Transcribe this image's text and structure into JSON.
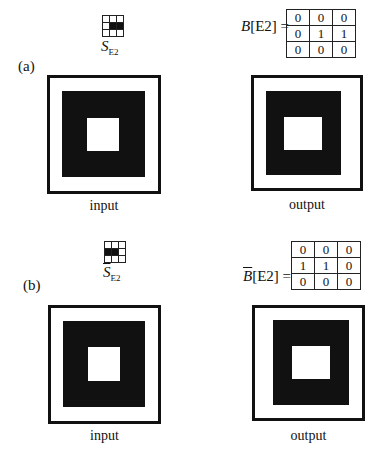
{
  "panels": [
    {
      "id": "a",
      "label": "(a)",
      "structuring_element": {
        "name": "S",
        "subscript": "E2",
        "overline": false,
        "grid": [
          [
            0,
            0,
            0
          ],
          [
            0,
            1,
            1
          ],
          [
            0,
            0,
            0
          ]
        ]
      },
      "matrix_label_var": "B",
      "matrix_label_rest": "[E2] =",
      "matrix_overline": false,
      "matrix": [
        [
          "0",
          "0",
          "0"
        ],
        [
          "0",
          "1",
          "1"
        ],
        [
          "0",
          "0",
          "0"
        ]
      ],
      "input_caption": "input",
      "output_caption": "output"
    },
    {
      "id": "b",
      "label": "(b)",
      "structuring_element": {
        "name": "S",
        "subscript": "E2",
        "overline": true,
        "grid": [
          [
            0,
            0,
            0
          ],
          [
            1,
            1,
            0
          ],
          [
            0,
            0,
            0
          ]
        ]
      },
      "matrix_label_var": "B",
      "matrix_label_rest": "[E2] =",
      "matrix_overline": true,
      "matrix": [
        [
          "0",
          "0",
          "0"
        ],
        [
          "1",
          "1",
          "0"
        ],
        [
          "0",
          "0",
          "0"
        ]
      ],
      "input_caption": "input",
      "output_caption": "output"
    }
  ]
}
